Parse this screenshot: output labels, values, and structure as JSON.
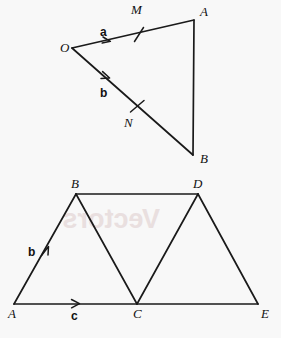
{
  "page": {
    "background_color": "#f8f8f8",
    "ink_color": "#1a1a1a",
    "bleed_text": "Vectors",
    "bleed_color": "#e9dede"
  },
  "figures": [
    {
      "id": "triangle-oab",
      "name": "triangle-o-a-b-with-midpoints",
      "vertices": [
        {
          "name": "O",
          "label": "O",
          "x": 72,
          "y": 48,
          "label_x": 60,
          "label_y": 52
        },
        {
          "name": "A",
          "label": "A",
          "x": 194,
          "y": 20,
          "label_x": 200,
          "label_y": 16
        },
        {
          "name": "B",
          "label": "B",
          "x": 193,
          "y": 155,
          "label_x": 200,
          "label_y": 163
        }
      ],
      "midpoints": [
        {
          "name": "M",
          "label": "M",
          "on": "OA",
          "x": 139,
          "y": 34,
          "label_x": 131,
          "label_y": 14
        },
        {
          "name": "N",
          "label": "N",
          "on": "OB",
          "x": 137,
          "y": 106,
          "label_x": 124,
          "label_y": 127
        }
      ],
      "edges": [
        {
          "name": "edge-OA",
          "from": "O",
          "to": "A"
        },
        {
          "name": "edge-OB",
          "from": "O",
          "to": "B"
        },
        {
          "name": "edge-AB",
          "from": "A",
          "to": "B"
        }
      ],
      "vector_labels": [
        {
          "name": "vector-a",
          "label": "a",
          "x": 100,
          "y": 36,
          "on_edge": "OA"
        },
        {
          "name": "vector-b",
          "label": "b",
          "x": 100,
          "y": 97,
          "on_edge": "OB"
        }
      ],
      "arrow_marks": [
        {
          "name": "arrowhead-a",
          "edge": "OA",
          "t": 0.3
        },
        {
          "name": "arrowhead-b",
          "edge": "OB",
          "t": 0.3
        }
      ],
      "tick_marks": [
        {
          "name": "tick-M",
          "at": "M"
        },
        {
          "name": "tick-N",
          "at": "N"
        }
      ]
    },
    {
      "id": "trapezium-abcde",
      "name": "two-triangles-on-line-ace",
      "vertices": [
        {
          "name": "A",
          "label": "A",
          "x": 14,
          "y": 304,
          "label_x": 8,
          "label_y": 318
        },
        {
          "name": "B",
          "label": "B",
          "x": 76,
          "y": 194,
          "label_x": 71,
          "label_y": 188
        },
        {
          "name": "C",
          "label": "C",
          "x": 137,
          "y": 304,
          "label_x": 133,
          "label_y": 318
        },
        {
          "name": "D",
          "label": "D",
          "x": 198,
          "y": 194,
          "label_x": 193,
          "label_y": 188
        },
        {
          "name": "E",
          "label": "E",
          "x": 258,
          "y": 304,
          "label_x": 261,
          "label_y": 318
        }
      ],
      "edges": [
        {
          "name": "edge-AB",
          "from": "A",
          "to": "B"
        },
        {
          "name": "edge-BC",
          "from": "B",
          "to": "C"
        },
        {
          "name": "edge-CD",
          "from": "C",
          "to": "D"
        },
        {
          "name": "edge-DE",
          "from": "D",
          "to": "E"
        },
        {
          "name": "edge-BD",
          "from": "B",
          "to": "D"
        },
        {
          "name": "edge-AE",
          "from": "A",
          "to": "E"
        }
      ],
      "vector_labels": [
        {
          "name": "vector-b",
          "label": "b",
          "x": 31,
          "y": 252,
          "on_edge": "AB"
        },
        {
          "name": "vector-c",
          "label": "c",
          "x": 74,
          "y": 318,
          "on_edge": "AC"
        }
      ],
      "arrow_marks": [
        {
          "name": "arrowhead-b",
          "edge": "AB",
          "t": 0.52
        },
        {
          "name": "arrowhead-c",
          "edge": "AC",
          "t": 0.5
        }
      ]
    }
  ]
}
